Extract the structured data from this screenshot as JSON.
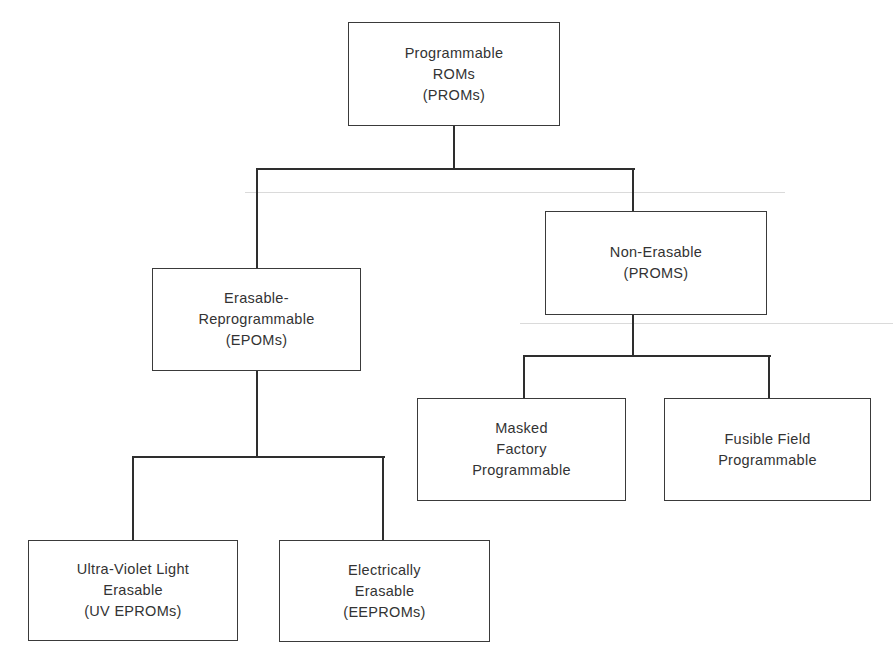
{
  "diagram": {
    "type": "hierarchy-tree",
    "nodes": {
      "root": {
        "lines": [
          "Programmable",
          "ROMs",
          "(PROMs)"
        ]
      },
      "erasable": {
        "lines": [
          "Erasable-",
          "Reprogrammable",
          "(EPOMs)"
        ]
      },
      "non_erasable": {
        "lines": [
          "Non-Erasable",
          "(PROMS)"
        ]
      },
      "uv": {
        "lines": [
          "Ultra-Violet Light",
          "Erasable",
          "(UV EPROMs)"
        ]
      },
      "ee": {
        "lines": [
          "Electrically",
          "Erasable",
          "(EEPROMs)"
        ]
      },
      "masked": {
        "lines": [
          "Masked",
          "Factory",
          "Programmable"
        ]
      },
      "fusible": {
        "lines": [
          "Fusible Field",
          "Programmable"
        ]
      }
    },
    "edges": [
      [
        "root",
        "erasable"
      ],
      [
        "root",
        "non_erasable"
      ],
      [
        "erasable",
        "uv"
      ],
      [
        "erasable",
        "ee"
      ],
      [
        "non_erasable",
        "masked"
      ],
      [
        "non_erasable",
        "fusible"
      ]
    ],
    "colors": {
      "line": "#2e2e2e",
      "text": "#333333",
      "background": "#ffffff"
    }
  }
}
